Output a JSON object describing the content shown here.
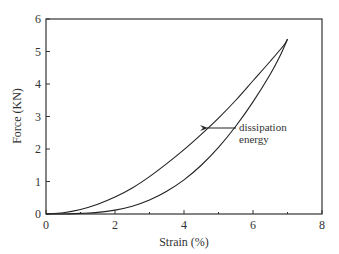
{
  "chart_data": {
    "type": "line",
    "title": "",
    "xlabel": "Strain (%)",
    "ylabel": "Force (KN)",
    "xlim": [
      0,
      8
    ],
    "ylim": [
      0,
      6
    ],
    "xticks": [
      "0",
      "2",
      "4",
      "6",
      "8"
    ],
    "yticks": [
      "0",
      "1",
      "2",
      "3",
      "4",
      "5",
      "6"
    ],
    "grid": false,
    "legend": null,
    "series": [
      {
        "name": "loading",
        "x": [
          0,
          0.5,
          1,
          1.5,
          2,
          2.5,
          3,
          3.5,
          4,
          4.5,
          5,
          5.5,
          6,
          6.5,
          6.9,
          7.0
        ],
        "y": [
          0,
          0.04,
          0.14,
          0.3,
          0.52,
          0.8,
          1.15,
          1.55,
          1.98,
          2.45,
          2.95,
          3.5,
          4.1,
          4.7,
          5.2,
          5.38
        ]
      },
      {
        "name": "unloading",
        "x": [
          7.0,
          6.8,
          6.5,
          6.0,
          5.5,
          5.0,
          4.5,
          4.0,
          3.5,
          3.0,
          2.5,
          2.0,
          1.5,
          1.0,
          0.5,
          0
        ],
        "y": [
          5.38,
          4.9,
          4.3,
          3.45,
          2.7,
          2.05,
          1.5,
          1.05,
          0.7,
          0.43,
          0.24,
          0.12,
          0.05,
          0.02,
          0,
          0
        ]
      }
    ],
    "annotations": [
      {
        "text": "dissipation energy",
        "arrow_to": [
          4.5,
          2.6
        ]
      }
    ]
  },
  "annotation": {
    "line1": "dissipation",
    "line2": "energy"
  },
  "axes": {
    "xlabel": "Strain (%)",
    "ylabel": "Force (KN)"
  }
}
